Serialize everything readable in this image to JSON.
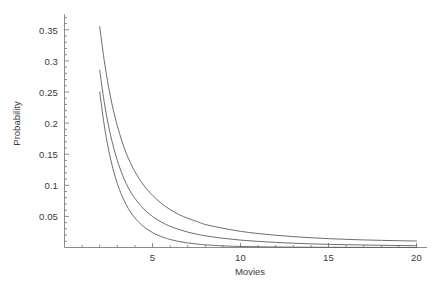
{
  "chart_data": {
    "type": "line",
    "title": "",
    "xlabel": "Movies",
    "ylabel": "Probability",
    "xlim": [
      0,
      20.6
    ],
    "ylim": [
      0,
      0.375
    ],
    "grid": false,
    "legend": "none",
    "xticks": [
      5,
      10,
      15,
      20
    ],
    "xtick_labels": [
      "5",
      "10",
      "15",
      "20"
    ],
    "yticks": [
      0.05,
      0.1,
      0.15,
      0.2,
      0.25,
      0.3,
      0.35
    ],
    "ytick_labels": [
      "0.05",
      "0.1",
      "0.15",
      "0.2",
      "0.25",
      "0.3",
      "0.35"
    ],
    "x_minor_tick_step": 1,
    "y_minor_tick_step": 0.01,
    "line_color": "#5c5c5c",
    "axis_color": "#6e6e6e",
    "background_color": "#ffffff",
    "series": [
      {
        "name": "curve-upper",
        "x": [
          2,
          2.25,
          2.5,
          2.75,
          3,
          3.25,
          3.5,
          3.75,
          4,
          4.5,
          5,
          5.5,
          6,
          6.5,
          7,
          7.5,
          8,
          9,
          10,
          11,
          12,
          13,
          14,
          15,
          16,
          17,
          18,
          19,
          20
        ],
        "y": [
          0.355,
          0.302,
          0.259,
          0.224,
          0.196,
          0.172,
          0.152,
          0.136,
          0.122,
          0.1,
          0.084,
          0.071,
          0.061,
          0.053,
          0.047,
          0.042,
          0.037,
          0.031,
          0.026,
          0.0225,
          0.0197,
          0.0175,
          0.0157,
          0.0142,
          0.0131,
          0.0122,
          0.0115,
          0.0109,
          0.0105
        ]
      },
      {
        "name": "curve-middle",
        "x": [
          2,
          2.25,
          2.5,
          2.75,
          3,
          3.25,
          3.5,
          3.75,
          4,
          4.5,
          5,
          5.5,
          6,
          6.5,
          7,
          7.5,
          8,
          9,
          10,
          11,
          12,
          13,
          14,
          15,
          16,
          17,
          18,
          19,
          20
        ],
        "y": [
          0.285,
          0.235,
          0.196,
          0.165,
          0.14,
          0.12,
          0.103,
          0.09,
          0.079,
          0.062,
          0.05,
          0.041,
          0.034,
          0.029,
          0.0248,
          0.0215,
          0.0188,
          0.0148,
          0.0119,
          0.0098,
          0.0082,
          0.0069,
          0.0059,
          0.0051,
          0.0045,
          0.004,
          0.0036,
          0.0032,
          0.003
        ]
      },
      {
        "name": "curve-lower",
        "x": [
          2,
          2.25,
          2.5,
          2.75,
          3,
          3.25,
          3.5,
          3.75,
          4,
          4.25,
          4.5,
          4.75,
          5,
          5.25,
          5.5,
          5.75,
          6,
          6.5,
          7,
          7.5,
          8,
          9,
          10,
          12,
          14,
          16,
          18,
          20
        ],
        "y": [
          0.25,
          0.198,
          0.158,
          0.127,
          0.103,
          0.084,
          0.069,
          0.057,
          0.0475,
          0.0398,
          0.0335,
          0.0283,
          0.024,
          0.0205,
          0.0175,
          0.015,
          0.0129,
          0.0097,
          0.0073,
          0.0056,
          0.0043,
          0.0026,
          0.0017,
          0.0008,
          0.0004,
          0.00022,
          0.00013,
          8e-05
        ]
      }
    ]
  },
  "axes": {
    "y_title": "Probability",
    "x_title": "Movies"
  }
}
